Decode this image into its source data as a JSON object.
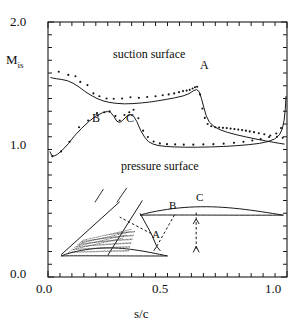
{
  "chart_data": {
    "type": "scatter",
    "title": "",
    "xlabel": "s/c",
    "ylabel": "M_is",
    "ylabel_base": "M",
    "ylabel_sub": "is",
    "xlim": [
      0.0,
      1.0
    ],
    "ylim": [
      0.0,
      2.0
    ],
    "xticks_major": [
      0.0,
      0.5,
      1.0
    ],
    "xtick_labels": [
      "0.0",
      "0.5",
      "1.0"
    ],
    "yticks_major": [
      0.0,
      1.0,
      2.0
    ],
    "ytick_labels": [
      "0.0",
      "1.0",
      "2.0"
    ],
    "xtick_minor_step": 0.05,
    "ytick_minor_step": 0.1,
    "grid": false,
    "legend_position": "inline-annotations",
    "annotations": [
      {
        "text": "suction surface",
        "x": 0.29,
        "y": 1.72
      },
      {
        "text": "pressure surface",
        "x": 0.33,
        "y": 0.85
      },
      {
        "text": "A",
        "x": 0.655,
        "y": 1.63
      },
      {
        "text": "B",
        "x": 0.195,
        "y": 1.15
      },
      {
        "text": "C",
        "x": 0.335,
        "y": 1.15
      },
      {
        "text": "A",
        "x": 0.45,
        "y": 0.235,
        "target": "inset"
      },
      {
        "text": "B",
        "x": 0.52,
        "y": 0.45,
        "target": "inset"
      },
      {
        "text": "C",
        "x": 0.635,
        "y": 0.5,
        "target": "inset"
      }
    ],
    "series": [
      {
        "name": "suction surface (line)",
        "style": "line",
        "points": [
          [
            0.01,
            1.565
          ],
          [
            0.02,
            1.56
          ],
          [
            0.035,
            1.555
          ],
          [
            0.055,
            1.55
          ],
          [
            0.08,
            1.54
          ],
          [
            0.105,
            1.52
          ],
          [
            0.13,
            1.49
          ],
          [
            0.155,
            1.455
          ],
          [
            0.18,
            1.425
          ],
          [
            0.205,
            1.4
          ],
          [
            0.23,
            1.382
          ],
          [
            0.255,
            1.37
          ],
          [
            0.285,
            1.362
          ],
          [
            0.32,
            1.358
          ],
          [
            0.355,
            1.36
          ],
          [
            0.39,
            1.365
          ],
          [
            0.425,
            1.372
          ],
          [
            0.46,
            1.382
          ],
          [
            0.495,
            1.393
          ],
          [
            0.53,
            1.405
          ],
          [
            0.565,
            1.42
          ],
          [
            0.59,
            1.438
          ],
          [
            0.61,
            1.462
          ],
          [
            0.622,
            1.47
          ],
          [
            0.632,
            1.455
          ],
          [
            0.642,
            1.4
          ],
          [
            0.652,
            1.33
          ],
          [
            0.662,
            1.265
          ],
          [
            0.675,
            1.215
          ],
          [
            0.695,
            1.18
          ],
          [
            0.72,
            1.155
          ],
          [
            0.75,
            1.135
          ],
          [
            0.79,
            1.115
          ],
          [
            0.83,
            1.098
          ],
          [
            0.87,
            1.082
          ],
          [
            0.91,
            1.068
          ],
          [
            0.945,
            1.056
          ],
          [
            0.97,
            1.048
          ],
          [
            0.99,
            1.042
          ]
        ]
      },
      {
        "name": "suction surface (measured)",
        "style": "points",
        "points": [
          [
            0.045,
            1.61
          ],
          [
            0.085,
            1.585
          ],
          [
            0.115,
            1.575
          ],
          [
            0.135,
            1.53
          ],
          [
            0.165,
            1.505
          ],
          [
            0.19,
            1.44
          ],
          [
            0.215,
            1.418
          ],
          [
            0.245,
            1.4
          ],
          [
            0.275,
            1.398
          ],
          [
            0.31,
            1.4
          ],
          [
            0.345,
            1.41
          ],
          [
            0.38,
            1.405
          ],
          [
            0.415,
            1.412
          ],
          [
            0.45,
            1.418
          ],
          [
            0.48,
            1.425
          ],
          [
            0.505,
            1.432
          ],
          [
            0.528,
            1.44
          ],
          [
            0.548,
            1.45
          ],
          [
            0.565,
            1.458
          ],
          [
            0.58,
            1.462
          ],
          [
            0.593,
            1.468
          ],
          [
            0.605,
            1.478
          ],
          [
            0.615,
            1.488
          ],
          [
            0.624,
            1.492
          ],
          [
            0.636,
            1.432
          ],
          [
            0.646,
            1.322
          ],
          [
            0.656,
            1.248
          ],
          [
            0.668,
            1.2
          ],
          [
            0.683,
            1.182
          ],
          [
            0.7,
            1.175
          ],
          [
            0.716,
            1.172
          ],
          [
            0.732,
            1.17
          ],
          [
            0.748,
            1.168
          ],
          [
            0.764,
            1.164
          ],
          [
            0.78,
            1.16
          ],
          [
            0.796,
            1.156
          ],
          [
            0.812,
            1.152
          ],
          [
            0.828,
            1.148
          ],
          [
            0.844,
            1.142
          ],
          [
            0.862,
            1.136
          ],
          [
            0.882,
            1.128
          ],
          [
            0.905,
            1.12
          ],
          [
            0.93,
            1.11
          ],
          [
            0.958,
            1.1
          ],
          [
            0.982,
            1.092
          ]
        ]
      },
      {
        "name": "pressure surface (line)",
        "style": "line",
        "points": [
          [
            0.008,
            0.985
          ],
          [
            0.015,
            0.955
          ],
          [
            0.025,
            0.948
          ],
          [
            0.04,
            0.962
          ],
          [
            0.06,
            0.995
          ],
          [
            0.085,
            1.045
          ],
          [
            0.11,
            1.105
          ],
          [
            0.14,
            1.165
          ],
          [
            0.17,
            1.218
          ],
          [
            0.2,
            1.262
          ],
          [
            0.228,
            1.288
          ],
          [
            0.248,
            1.298
          ],
          [
            0.262,
            1.292
          ],
          [
            0.276,
            1.258
          ],
          [
            0.288,
            1.222
          ],
          [
            0.3,
            1.212
          ],
          [
            0.312,
            1.228
          ],
          [
            0.328,
            1.258
          ],
          [
            0.344,
            1.272
          ],
          [
            0.358,
            1.262
          ],
          [
            0.372,
            1.218
          ],
          [
            0.388,
            1.148
          ],
          [
            0.404,
            1.098
          ],
          [
            0.42,
            1.062
          ],
          [
            0.44,
            1.042
          ],
          [
            0.465,
            1.03
          ],
          [
            0.495,
            1.024
          ],
          [
            0.53,
            1.02
          ],
          [
            0.575,
            1.018
          ],
          [
            0.625,
            1.018
          ],
          [
            0.68,
            1.02
          ],
          [
            0.735,
            1.024
          ],
          [
            0.79,
            1.03
          ],
          [
            0.84,
            1.038
          ],
          [
            0.885,
            1.048
          ],
          [
            0.92,
            1.062
          ],
          [
            0.948,
            1.082
          ],
          [
            0.968,
            1.115
          ],
          [
            0.98,
            1.16
          ],
          [
            0.988,
            1.23
          ],
          [
            0.993,
            1.32
          ],
          [
            0.996,
            1.42
          ]
        ]
      },
      {
        "name": "pressure surface (measured)",
        "style": "points",
        "points": [
          [
            0.018,
            0.948
          ],
          [
            0.055,
            0.985
          ],
          [
            0.09,
            1.06
          ],
          [
            0.13,
            1.175
          ],
          [
            0.168,
            1.228
          ],
          [
            0.205,
            1.285
          ],
          [
            0.235,
            1.292
          ],
          [
            0.258,
            1.3
          ],
          [
            0.282,
            1.262
          ],
          [
            0.3,
            1.228
          ],
          [
            0.32,
            1.27
          ],
          [
            0.34,
            1.292
          ],
          [
            0.358,
            1.312
          ],
          [
            0.378,
            1.245
          ],
          [
            0.398,
            1.148
          ],
          [
            0.418,
            1.098
          ],
          [
            0.442,
            1.062
          ],
          [
            0.468,
            1.048
          ],
          [
            0.498,
            1.042
          ],
          [
            0.532,
            1.04
          ],
          [
            0.568,
            1.038
          ],
          [
            0.608,
            1.038
          ],
          [
            0.65,
            1.04
          ],
          [
            0.692,
            1.042
          ],
          [
            0.735,
            1.046
          ],
          [
            0.778,
            1.052
          ],
          [
            0.818,
            1.06
          ],
          [
            0.855,
            1.07
          ],
          [
            0.89,
            1.082
          ],
          [
            0.925,
            1.098
          ],
          [
            0.955,
            1.125
          ],
          [
            0.975,
            1.168
          ]
        ]
      }
    ],
    "inset": {
      "description": "turbine blade cascade passage with shock waves labelled A, B, C",
      "blades": [
        {
          "name": "upper-blade",
          "y": 0.5
        },
        {
          "name": "lower-blade",
          "y": 0.18
        }
      ],
      "shock_lines": [
        "inlet-oblique",
        "A-passage-shock",
        "B-reflected-shock",
        "C-trailing-shock"
      ]
    }
  }
}
